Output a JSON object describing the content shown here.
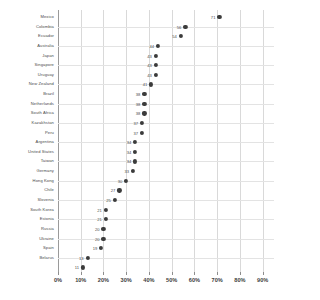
{
  "chart_data": {
    "type": "scatter",
    "title": "",
    "xlabel": "",
    "ylabel": "",
    "xlim": [
      0,
      95
    ],
    "grid": true,
    "legend": "none",
    "value_suffix": "",
    "categories": [
      "Mexico",
      "Colombia",
      "Ecuador",
      "Australia",
      "Japan",
      "Singapore",
      "Uruguay",
      "New Zealand",
      "Brazil",
      "Netherlands",
      "South Africa",
      "Kazakhstan",
      "Peru",
      "Argentina",
      "United States",
      "Taiwan",
      "Germany",
      "Hong Kong",
      "Chile",
      "Slovenia",
      "South Korea",
      "Estonia",
      "Russia",
      "Ukraine",
      "Spain",
      "Belarus"
    ],
    "values": [
      71,
      56,
      54,
      44,
      43,
      43,
      43,
      41,
      38,
      38,
      38,
      37,
      37,
      34,
      34,
      34,
      33,
      30,
      27,
      25,
      21,
      21,
      20,
      20,
      19,
      13
    ],
    "xticks": [
      0,
      10,
      20,
      30,
      40,
      50,
      60,
      70,
      80,
      90
    ],
    "xtick_labels": [
      "0%",
      "10%",
      "20%",
      "30%",
      "40%",
      "50%",
      "60%",
      "70%",
      "80%",
      "90%"
    ],
    "extra_point": {
      "label": "11",
      "value": 11
    },
    "colors": {
      "dot": "#3b3b3b",
      "grid": "#d9d9d9",
      "text": "#4a4a4a"
    }
  }
}
